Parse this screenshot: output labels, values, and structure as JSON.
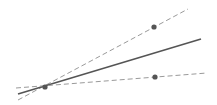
{
  "diagram": {
    "type": "geometry-rays",
    "vertex": {
      "x": 45,
      "y": 87
    },
    "lines": [
      {
        "id": "upper-dashed",
        "style": "dashed",
        "x1": 18,
        "y1": 100,
        "x2": 188,
        "y2": 9,
        "color": "#9a9a9a"
      },
      {
        "id": "solid",
        "style": "solid",
        "x1": 18,
        "y1": 94,
        "x2": 201,
        "y2": 39,
        "color": "#555555"
      },
      {
        "id": "lower-dashed",
        "style": "dashed",
        "x1": 16,
        "y1": 88,
        "x2": 207,
        "y2": 73,
        "color": "#9a9a9a"
      }
    ],
    "points": [
      {
        "id": "vertex",
        "x": 45,
        "y": 87
      },
      {
        "id": "upper-point",
        "x": 154,
        "y": 27
      },
      {
        "id": "lower-point",
        "x": 155,
        "y": 77
      }
    ],
    "colors": {
      "point": "#555555"
    }
  }
}
